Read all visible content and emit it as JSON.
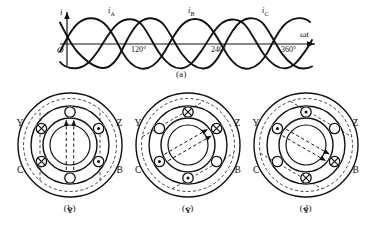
{
  "figure": {
    "panels": [
      {
        "id": "a",
        "caption": "(a)",
        "type": "waveform",
        "yaxis_label": "i",
        "xaxis_label": "ωt",
        "origin_label": "O",
        "curve_labels": [
          {
            "base": "i",
            "sub": "A"
          },
          {
            "base": "i",
            "sub": "B"
          },
          {
            "base": "i",
            "sub": "C"
          }
        ],
        "tick_labels": [
          "120°",
          "240°",
          "360°"
        ]
      },
      {
        "id": "b",
        "caption": "(b)",
        "type": "cross-section",
        "terminals": [
          {
            "label": "A",
            "marker": "empty"
          },
          {
            "label": "Z",
            "marker": "dot"
          },
          {
            "label": "B",
            "marker": "dot"
          },
          {
            "label": "X",
            "marker": "empty"
          },
          {
            "label": "C",
            "marker": "cross"
          },
          {
            "label": "Y",
            "marker": "cross"
          }
        ],
        "field_angle_deg": 90,
        "field_arrows": 2
      },
      {
        "id": "c",
        "caption": "(c)",
        "type": "cross-section",
        "terminals": [
          {
            "label": "A",
            "marker": "cross"
          },
          {
            "label": "Z",
            "marker": "cross"
          },
          {
            "label": "B",
            "marker": "empty"
          },
          {
            "label": "X",
            "marker": "dot"
          },
          {
            "label": "C",
            "marker": "dot"
          },
          {
            "label": "Y",
            "marker": "empty"
          }
        ],
        "field_angle_deg": 30,
        "field_arrows": 2
      },
      {
        "id": "d",
        "caption": "(d)",
        "type": "cross-section",
        "terminals": [
          {
            "label": "A",
            "marker": "dot"
          },
          {
            "label": "Z",
            "marker": "empty"
          },
          {
            "label": "B",
            "marker": "cross"
          },
          {
            "label": "X",
            "marker": "cross"
          },
          {
            "label": "C",
            "marker": "empty"
          },
          {
            "label": "Y",
            "marker": "dot"
          }
        ],
        "field_angle_deg": -30,
        "field_arrows": 2
      }
    ],
    "colors": {
      "ink": "#111111",
      "paper": "#ffffff"
    }
  }
}
